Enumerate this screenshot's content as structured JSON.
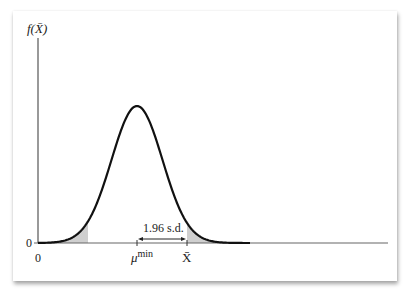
{
  "figure": {
    "y_axis_label": "f(X̄)",
    "y_origin_label": "0",
    "x_origin_label": "0",
    "mu_label": "μ",
    "mu_superscript": "min",
    "xbar_label": "X̄",
    "interval_label": "1.96 s.d."
  },
  "chart_data": {
    "type": "area",
    "title": "",
    "xlabel": "",
    "ylabel": "f(X̄)",
    "x_ticks": [
      "0",
      "μ^min",
      "X̄"
    ],
    "y_ticks": [
      "0"
    ],
    "center": "μ^min",
    "critical_distance": "1.96 s.d.",
    "shaded_regions": [
      "left tail below μ^min − 1.96 s.d.",
      "right tail above X̄ = μ^min + 1.96 s.d."
    ],
    "colors": {
      "curve": "#111111",
      "shade": "#cfcfcf",
      "axis": "#555555"
    }
  }
}
